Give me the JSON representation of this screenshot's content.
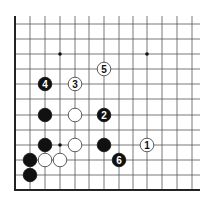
{
  "diagram": {
    "board": {
      "edges": [
        "left",
        "bottom"
      ],
      "columns": 13,
      "rows": 11,
      "origin_x": 15,
      "origin_y_bottom": 190,
      "spacing_x": 14.75,
      "spacing_y": 15.1,
      "top_line_y": 24,
      "right_extent_x": 200,
      "top_extent_y": 16
    },
    "star_points": [
      {
        "col": 3,
        "row": 2
      },
      {
        "col": 9,
        "row": 2
      },
      {
        "col": 3,
        "row": 8
      }
    ],
    "stones": [
      {
        "color": "white",
        "col": 6,
        "row": 3,
        "label": "5"
      },
      {
        "color": "black",
        "col": 2,
        "row": 4,
        "label": "4"
      },
      {
        "color": "white",
        "col": 4,
        "row": 4,
        "label": "3"
      },
      {
        "color": "black",
        "col": 2,
        "row": 6,
        "label": ""
      },
      {
        "color": "white",
        "col": 4,
        "row": 6,
        "label": ""
      },
      {
        "color": "black",
        "col": 6,
        "row": 6,
        "label": "2"
      },
      {
        "color": "black",
        "col": 2,
        "row": 8,
        "label": ""
      },
      {
        "color": "white",
        "col": 4,
        "row": 8,
        "label": ""
      },
      {
        "color": "black",
        "col": 6,
        "row": 8,
        "label": ""
      },
      {
        "color": "white",
        "col": 9,
        "row": 8,
        "label": "1"
      },
      {
        "color": "black",
        "col": 7,
        "row": 9,
        "label": "6"
      },
      {
        "color": "black",
        "col": 1,
        "row": 9,
        "label": ""
      },
      {
        "color": "white",
        "col": 2,
        "row": 9,
        "label": ""
      },
      {
        "color": "white",
        "col": 3,
        "row": 9,
        "label": ""
      },
      {
        "color": "black",
        "col": 1,
        "row": 10,
        "label": ""
      }
    ],
    "colors": {
      "line": "#555555",
      "edge": "#222222",
      "black_stone": "#111111",
      "white_stone": "#ffffff",
      "white_stroke": "#333333"
    }
  }
}
